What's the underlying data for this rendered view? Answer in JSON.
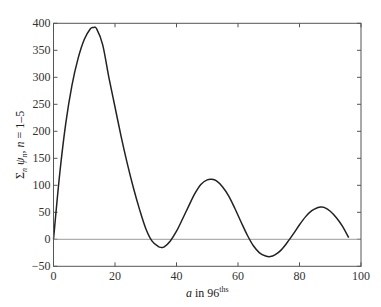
{
  "chart_data": {
    "type": "line",
    "title": "",
    "xlabel": "a in 96ths",
    "xlabel_parts": {
      "main": "a in 96",
      "sup": "ths"
    },
    "ylabel": "Σn ψn, n = 1–5",
    "ylabel_parts": {
      "sigma": "Σ",
      "sigma_sub": "n",
      "psi": "ψ",
      "psi_sub": "n",
      "rest": ", n = 1–5"
    },
    "xlim": [
      0,
      100
    ],
    "ylim": [
      -50,
      400
    ],
    "xticks": [
      0,
      20,
      40,
      60,
      80,
      100
    ],
    "yticks": [
      -50,
      0,
      50,
      100,
      150,
      200,
      250,
      300,
      350,
      400
    ],
    "grid": false,
    "legend": null,
    "reference_line": {
      "y": 0,
      "color": "#9a9a9a"
    },
    "line_color": "#222222",
    "series": [
      {
        "name": "sum psi_n, n=1-5",
        "x": [
          0,
          2,
          4,
          6,
          8,
          10,
          12,
          13,
          14,
          16,
          18,
          20,
          22,
          24,
          26,
          28,
          30,
          32,
          34,
          35,
          36,
          38,
          40,
          42,
          44,
          46,
          48,
          50,
          51.5,
          53,
          55,
          57,
          59,
          61,
          63,
          65,
          67,
          69,
          70.5,
          72,
          74,
          76,
          78,
          80,
          82,
          84,
          86,
          87,
          88,
          90,
          92,
          94,
          96
        ],
        "y": [
          0,
          120,
          215,
          285,
          335,
          370,
          390,
          392,
          390,
          360,
          300,
          245,
          190,
          140,
          95,
          55,
          20,
          -3,
          -13,
          -15,
          -14,
          -3,
          15,
          38,
          62,
          85,
          102,
          110,
          111,
          108,
          97,
          80,
          57,
          32,
          8,
          -12,
          -25,
          -31,
          -32,
          -29,
          -20,
          -6,
          10,
          27,
          42,
          53,
          59,
          60,
          59,
          52,
          40,
          24,
          3
        ]
      }
    ]
  }
}
